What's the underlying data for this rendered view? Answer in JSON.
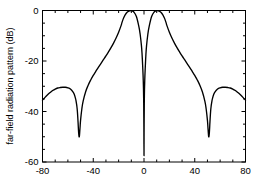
{
  "chart_data": {
    "type": "line",
    "title": "",
    "xlabel": "",
    "ylabel": "far-field radiation pattern (dB)",
    "xlim": [
      -80,
      80
    ],
    "ylim": [
      -60,
      0
    ],
    "xticks": [
      -80,
      -40,
      0,
      40,
      80
    ],
    "xticklabels": [
      "-80",
      "-40",
      "0",
      "40",
      "80"
    ],
    "yticks": [
      0,
      -20,
      -40,
      -60
    ],
    "yticklabels": [
      "0",
      "-20",
      "-40",
      "-60"
    ],
    "grid": false,
    "legend": null,
    "line_color": "#000000",
    "background_color": "#ffffff",
    "frame_color": "#000000",
    "annotations": [],
    "features": {
      "main_lobe_peaks_deg": [
        -17.5,
        17.5
      ],
      "main_lobe_peak_db": 0,
      "center_null_deg": 0,
      "center_null_db": -57.5,
      "side_nulls_deg": [
        -52,
        52
      ],
      "side_null_db": -50,
      "sidelobe_peaks_deg": [
        -62,
        62
      ],
      "sidelobe_peak_db": -30.5,
      "edge_values_db": [
        -35.5,
        -35.5
      ]
    },
    "series": [
      {
        "name": "far-field radiation pattern",
        "x": [
          -80,
          -78,
          -76,
          -74,
          -72,
          -70,
          -68,
          -66,
          -64,
          -62,
          -60,
          -58,
          -56,
          -55,
          -54,
          -53.5,
          -53,
          -52.5,
          -52,
          -51.5,
          -51,
          -50.5,
          -50,
          -49,
          -48,
          -46,
          -44,
          -42,
          -40,
          -38,
          -36,
          -34,
          -32,
          -30,
          -28,
          -26,
          -24,
          -22,
          -20,
          -18,
          -17.5,
          -16,
          -14,
          -12,
          -10,
          -8,
          -6,
          -4,
          -3,
          -2,
          -1.5,
          -1,
          -0.6,
          -0.3,
          -0.1,
          0,
          0.1,
          0.3,
          0.6,
          1,
          1.5,
          2,
          3,
          4,
          6,
          8,
          10,
          12,
          14,
          16,
          17.5,
          18,
          20,
          22,
          24,
          26,
          28,
          30,
          32,
          34,
          36,
          38,
          40,
          42,
          44,
          46,
          48,
          49,
          50,
          50.5,
          51,
          51.5,
          52,
          52.5,
          53,
          53.5,
          54,
          55,
          56,
          58,
          60,
          62,
          64,
          66,
          68,
          70,
          72,
          74,
          76,
          78,
          80
        ],
        "y": [
          -35.5,
          -34.4,
          -33.4,
          -32.5,
          -31.7,
          -31.1,
          -30.7,
          -30.5,
          -30.4,
          -30.4,
          -30.6,
          -31.1,
          -32.2,
          -33.2,
          -34.8,
          -36.0,
          -37.6,
          -40.0,
          -44.0,
          -48.5,
          -50.0,
          -47.0,
          -43.5,
          -39.0,
          -36.0,
          -32.2,
          -29.6,
          -27.5,
          -25.7,
          -24.1,
          -22.5,
          -21.0,
          -19.5,
          -18.0,
          -16.4,
          -14.7,
          -12.9,
          -10.9,
          -8.6,
          -5.9,
          -5.0,
          -2.9,
          -1.1,
          -0.25,
          -0.05,
          -0.6,
          -2.4,
          -6.5,
          -9.5,
          -14.0,
          -17.5,
          -22.5,
          -27.5,
          -34.0,
          -45.0,
          -57.5,
          -45.0,
          -34.0,
          -27.5,
          -22.5,
          -17.5,
          -14.0,
          -9.5,
          -6.5,
          -2.4,
          -0.6,
          -0.05,
          -0.25,
          -1.1,
          -2.9,
          -5.0,
          -5.9,
          -8.6,
          -10.9,
          -12.9,
          -14.7,
          -16.4,
          -18.0,
          -19.5,
          -21.0,
          -22.5,
          -24.1,
          -25.7,
          -27.5,
          -29.6,
          -32.2,
          -36.0,
          -39.0,
          -43.5,
          -47.0,
          -50.0,
          -48.5,
          -44.0,
          -40.0,
          -37.6,
          -36.0,
          -34.8,
          -33.2,
          -32.2,
          -31.1,
          -30.6,
          -30.4,
          -30.4,
          -30.5,
          -30.7,
          -31.1,
          -31.7,
          -32.5,
          -33.4,
          -34.4,
          -35.5
        ]
      }
    ]
  }
}
